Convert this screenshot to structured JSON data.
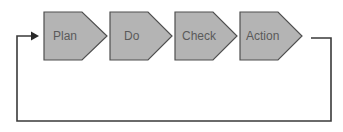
{
  "diagram": {
    "type": "cycle",
    "steps": [
      {
        "label": "Plan"
      },
      {
        "label": "Do"
      },
      {
        "label": "Check"
      },
      {
        "label": "Action"
      }
    ],
    "colors": {
      "step_fill": "#b4b4b4",
      "step_stroke": "#4f4f4f",
      "label_text": "#5a5a5a",
      "loop_line": "#3a3a3a",
      "background": "#ffffff"
    }
  }
}
